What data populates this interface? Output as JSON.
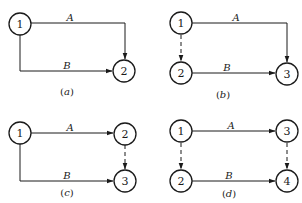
{
  "colors": {
    "line": "#1a1a1a",
    "background": "#ffffff"
  },
  "panels": [
    {
      "id": "a",
      "caption_open": "(",
      "caption_letter": "a",
      "caption_close": ")",
      "nodes": [
        {
          "label": "1"
        },
        {
          "label": "2"
        }
      ],
      "edges": [
        {
          "label": "A",
          "from": "1",
          "to": "2",
          "style": "solid"
        },
        {
          "label": "B",
          "from": "1",
          "to": "2",
          "style": "solid"
        }
      ]
    },
    {
      "id": "b",
      "caption_open": "(",
      "caption_letter": "b",
      "caption_close": ")",
      "nodes": [
        {
          "label": "1"
        },
        {
          "label": "2"
        },
        {
          "label": "3"
        }
      ],
      "edges": [
        {
          "label": "A",
          "from": "1",
          "to": "3",
          "style": "solid"
        },
        {
          "label": "",
          "from": "1",
          "to": "2",
          "style": "dashed"
        },
        {
          "label": "B",
          "from": "2",
          "to": "3",
          "style": "solid"
        }
      ]
    },
    {
      "id": "c",
      "caption_open": "(",
      "caption_letter": "c",
      "caption_close": ")",
      "nodes": [
        {
          "label": "1"
        },
        {
          "label": "2"
        },
        {
          "label": "3"
        }
      ],
      "edges": [
        {
          "label": "A",
          "from": "1",
          "to": "2",
          "style": "solid"
        },
        {
          "label": "",
          "from": "2",
          "to": "3",
          "style": "dashed"
        },
        {
          "label": "B",
          "from": "1",
          "to": "3",
          "style": "solid"
        }
      ]
    },
    {
      "id": "d",
      "caption_open": "(",
      "caption_letter": "d",
      "caption_close": ")",
      "nodes": [
        {
          "label": "1"
        },
        {
          "label": "2"
        },
        {
          "label": "3"
        },
        {
          "label": "4"
        }
      ],
      "edges": [
        {
          "label": "A",
          "from": "1",
          "to": "3",
          "style": "solid"
        },
        {
          "label": "",
          "from": "1",
          "to": "2",
          "style": "dashed"
        },
        {
          "label": "",
          "from": "3",
          "to": "4",
          "style": "dashed"
        },
        {
          "label": "B",
          "from": "2",
          "to": "4",
          "style": "solid"
        }
      ]
    }
  ]
}
